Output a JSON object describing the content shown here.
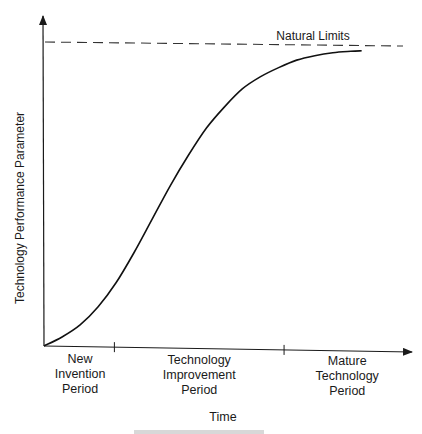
{
  "chart_data": {
    "type": "line",
    "title": "",
    "xlabel": "Time",
    "ylabel": "Technology Performance Parameter",
    "xlim": [
      0,
      1
    ],
    "ylim": [
      0,
      1
    ],
    "grid": false,
    "units": "normalized (conceptual diagram, no numeric scale)",
    "series": [
      {
        "name": "Technology S-curve",
        "x": [
          0.0,
          0.05,
          0.1,
          0.15,
          0.2,
          0.25,
          0.3,
          0.35,
          0.4,
          0.45,
          0.5,
          0.55,
          0.6,
          0.65,
          0.7,
          0.75,
          0.8,
          0.85,
          0.88
        ],
        "y": [
          0.0,
          0.03,
          0.07,
          0.13,
          0.21,
          0.31,
          0.42,
          0.53,
          0.63,
          0.72,
          0.79,
          0.85,
          0.89,
          0.92,
          0.945,
          0.96,
          0.97,
          0.975,
          0.977
        ]
      }
    ],
    "reference_lines": [
      {
        "name": "Natural Limits",
        "axis": "y",
        "value": 1.0,
        "style": "dashed",
        "label": "Natural Limits"
      }
    ],
    "x_ticks": [
      0.195,
      0.665
    ],
    "periods": [
      {
        "lines": [
          "New",
          "Invention",
          "Period"
        ],
        "center": 0.1
      },
      {
        "lines": [
          "Technology",
          "Improvement",
          "Period"
        ],
        "center": 0.43
      },
      {
        "lines": [
          "Mature",
          "Technology",
          "Period"
        ],
        "center": 0.84
      }
    ],
    "caption": ""
  }
}
